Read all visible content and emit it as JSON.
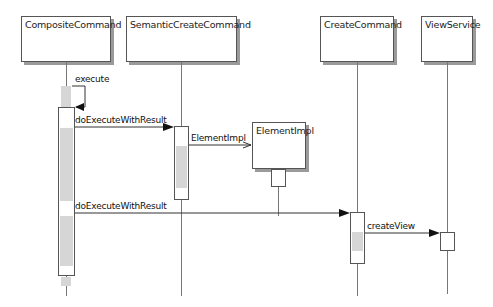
{
  "diagram": {
    "type": "UML sequence diagram",
    "participants": [
      {
        "id": "composite",
        "label": "CompositeCommand"
      },
      {
        "id": "semantic",
        "label": "SemanticCreateCommand"
      },
      {
        "id": "element",
        "label": "ElementImpl"
      },
      {
        "id": "create",
        "label": "CreateCommand"
      },
      {
        "id": "view",
        "label": "ViewService"
      }
    ],
    "messages": [
      {
        "from": "CompositeCommand",
        "to": "CompositeCommand",
        "label": "execute",
        "kind": "self-call"
      },
      {
        "from": "CompositeCommand",
        "to": "SemanticCreateCommand",
        "label": "doExecuteWithResult",
        "kind": "sync"
      },
      {
        "from": "SemanticCreateCommand",
        "to": "ElementImpl",
        "label": "ElementImpl",
        "kind": "create"
      },
      {
        "from": "CompositeCommand",
        "to": "CreateCommand",
        "label": "doExecuteWithResult",
        "kind": "sync"
      },
      {
        "from": "CreateCommand",
        "to": "ViewService",
        "label": "createView",
        "kind": "sync"
      }
    ]
  }
}
